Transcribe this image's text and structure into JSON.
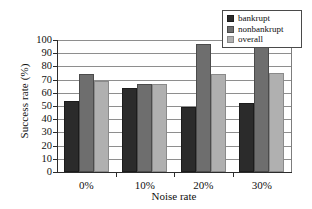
{
  "chart_data": {
    "type": "bar",
    "title": "",
    "xlabel": "Noise rate",
    "ylabel": "Success rate (%)",
    "categories": [
      "0%",
      "10%",
      "20%",
      "30%"
    ],
    "series": [
      {
        "name": "bankrupt",
        "color": "#2b2b2b",
        "values": [
          54,
          64,
          49,
          52
        ]
      },
      {
        "name": "nonbankrupt",
        "color": "#6e6e6e",
        "values": [
          74,
          67,
          97,
          96
        ]
      },
      {
        "name": "overall",
        "color": "#b0b0b0",
        "values": [
          69,
          67,
          74,
          75
        ]
      }
    ],
    "ylim": [
      0,
      100
    ],
    "ytick_step": 10,
    "yticks": [
      "100",
      "90",
      "80",
      "70",
      "60",
      "50",
      "40",
      "30",
      "20",
      "10",
      "0"
    ],
    "grid": true,
    "legend_position": "top-right"
  },
  "legend": {
    "items": [
      {
        "label": "bankrupt"
      },
      {
        "label": "nonbankrupt"
      },
      {
        "label": "overall"
      }
    ]
  }
}
